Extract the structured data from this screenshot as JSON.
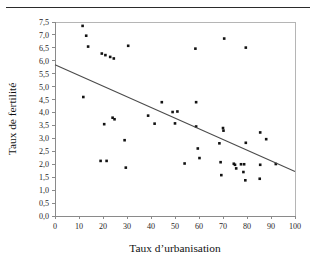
{
  "page": {
    "header_rule": "horizontal-rule"
  },
  "chart_data": {
    "type": "scatter",
    "title": "",
    "xlabel": "Taux d’urbanisation",
    "ylabel": "Taux de fertilité",
    "xlim": [
      0,
      100
    ],
    "ylim": [
      0.0,
      7.5
    ],
    "grid": false,
    "legend": null,
    "decimal_separator": ",",
    "xticks": [
      0,
      10,
      20,
      30,
      40,
      50,
      60,
      70,
      80,
      90,
      100
    ],
    "xtick_labels": [
      "0",
      "10",
      "20",
      "30",
      "40",
      "50",
      "60",
      "70",
      "80",
      "90",
      "100"
    ],
    "yticks": [
      0.0,
      0.5,
      1.0,
      1.5,
      2.0,
      2.5,
      3.0,
      3.5,
      4.0,
      4.5,
      5.0,
      5.5,
      6.0,
      6.5,
      7.0,
      7.5
    ],
    "ytick_labels": [
      "0,0",
      "0,5",
      "1,0",
      "1,5",
      "2,0",
      "2,5",
      "3,0",
      "3,5",
      "4,0",
      "4,5",
      "5,0",
      "5,5",
      "6,0",
      "6,5",
      "7,0",
      "7,5"
    ],
    "marker": "square",
    "marker_color": "#121212",
    "points": [
      [
        11.5,
        7.35
      ],
      [
        13.0,
        6.97
      ],
      [
        13.8,
        6.55
      ],
      [
        19.5,
        6.28
      ],
      [
        21.0,
        6.22
      ],
      [
        23.0,
        6.15
      ],
      [
        24.5,
        6.09
      ],
      [
        30.5,
        6.58
      ],
      [
        58.5,
        6.47
      ],
      [
        70.5,
        6.86
      ],
      [
        79.5,
        6.51
      ],
      [
        11.8,
        4.6
      ],
      [
        44.5,
        4.4
      ],
      [
        58.8,
        4.4
      ],
      [
        49.0,
        4.02
      ],
      [
        51.0,
        4.04
      ],
      [
        38.8,
        3.88
      ],
      [
        24.0,
        3.8
      ],
      [
        24.8,
        3.74
      ],
      [
        20.5,
        3.55
      ],
      [
        41.5,
        3.57
      ],
      [
        50.0,
        3.58
      ],
      [
        58.8,
        3.46
      ],
      [
        70.0,
        3.4
      ],
      [
        70.2,
        3.3
      ],
      [
        85.5,
        3.23
      ],
      [
        88.0,
        2.97
      ],
      [
        29.0,
        2.93
      ],
      [
        79.5,
        2.83
      ],
      [
        68.5,
        2.81
      ],
      [
        59.5,
        2.61
      ],
      [
        60.2,
        2.24
      ],
      [
        19.0,
        2.13
      ],
      [
        21.5,
        2.13
      ],
      [
        54.0,
        2.03
      ],
      [
        69.0,
        2.08
      ],
      [
        74.5,
        2.02
      ],
      [
        75.0,
        1.98
      ],
      [
        77.5,
        2.0
      ],
      [
        78.8,
        2.0
      ],
      [
        85.5,
        1.98
      ],
      [
        92.0,
        2.01
      ],
      [
        75.5,
        1.84
      ],
      [
        78.5,
        1.7
      ],
      [
        29.5,
        1.87
      ],
      [
        69.3,
        1.58
      ],
      [
        79.3,
        1.38
      ],
      [
        85.3,
        1.44
      ]
    ],
    "trendline": {
      "type": "linear",
      "x_start": 0,
      "y_start": 5.85,
      "x_end": 100,
      "y_end": 1.72,
      "color": "#4a4a4a"
    }
  }
}
